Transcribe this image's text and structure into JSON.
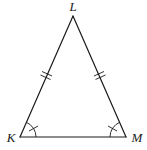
{
  "diagram": {
    "type": "isosceles-triangle",
    "vertices": [
      {
        "id": "L",
        "label": "L",
        "x": 73,
        "y": 16,
        "label_x": 73,
        "label_y": 11
      },
      {
        "id": "K",
        "label": "K",
        "x": 20,
        "y": 137,
        "label_x": 11,
        "label_y": 142
      },
      {
        "id": "M",
        "label": "M",
        "x": 126,
        "y": 137,
        "label_x": 136,
        "label_y": 142
      }
    ],
    "sides": [
      {
        "id": "KL",
        "from": "K",
        "to": "L",
        "congruence_ticks": 2
      },
      {
        "id": "LM",
        "from": "L",
        "to": "M",
        "congruence_ticks": 2
      },
      {
        "id": "KM",
        "from": "K",
        "to": "M",
        "congruence_ticks": 0
      }
    ],
    "angles": [
      {
        "vertex": "K",
        "arc_marks": 1,
        "arc_ticks": 1
      },
      {
        "vertex": "M",
        "arc_marks": 1,
        "arc_ticks": 1
      }
    ],
    "colors": {
      "stroke": "#1a1a1a",
      "background": "#ffffff"
    }
  }
}
